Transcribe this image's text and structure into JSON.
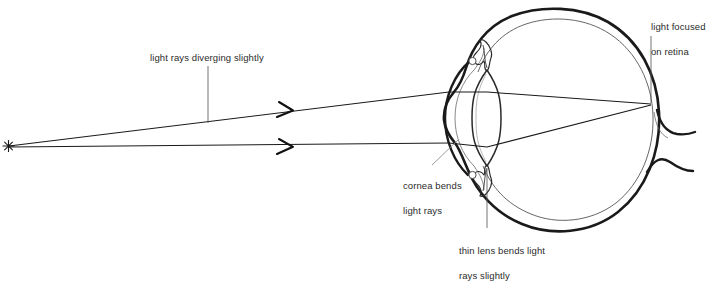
{
  "figure": {
    "type": "optics-anatomy-diagram",
    "background_color": "#ffffff",
    "ink_color": "#1a1a1a",
    "detail_color": "#5a5a5a",
    "text_color": "#2b2b2b"
  },
  "labels": {
    "diverging": {
      "text": "light rays diverging slightly",
      "x": 150,
      "y": 52,
      "leader": {
        "type": "vertical",
        "x": 208,
        "y1": 66,
        "y2": 123
      }
    },
    "focused": {
      "line1": "light focused",
      "line2": "on retina",
      "x": 640,
      "y": 8,
      "leader": {
        "type": "vertical",
        "x": 651,
        "y1": 36,
        "y2": 103
      }
    },
    "cornea": {
      "line1": "cornea bends",
      "line2": "light rays",
      "x": 392,
      "y": 167,
      "leader": {
        "type": "diagonal",
        "x1": 432,
        "y1": 165,
        "x2": 457,
        "y2": 141
      }
    },
    "lens": {
      "line1": "thin lens bends light",
      "line2": "rays slightly",
      "x": 448,
      "y": 232,
      "leader": {
        "type": "vertical",
        "x": 487,
        "y1": 169,
        "y2": 228
      }
    }
  },
  "light_source": {
    "name": "point-light-source",
    "glyph": "asterisk",
    "x": 8,
    "y": 146
  },
  "rays": [
    {
      "name": "upper-ray",
      "from_x": 8,
      "from_y": 146,
      "arrow_x": 290,
      "arrow_y": 110,
      "cornea_x": 449,
      "cornea_y": 92,
      "focus_x": 651,
      "focus_y": 104
    },
    {
      "name": "lower-ray",
      "from_x": 8,
      "from_y": 146,
      "arrow_x": 290,
      "arrow_y": 147,
      "cornea_x": 449,
      "cornea_y": 143,
      "focus_x": 651,
      "focus_y": 104
    }
  ],
  "anatomy": {
    "sclera": "bold outer globe wall",
    "retina": "thin inner lining",
    "cornea": "bold anterior bulge",
    "lens": "biconvex thin lens",
    "ciliary_body": "upper and lower zonule/ciliary structures",
    "optic_nerve": "exits posteriorly on the right"
  }
}
